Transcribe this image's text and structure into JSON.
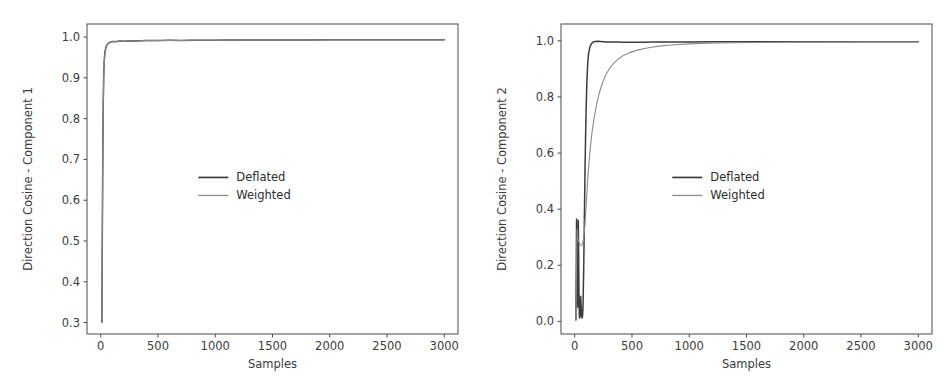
{
  "figure": {
    "background": "#ffffff",
    "panel_count": 2
  },
  "chart_data": [
    {
      "panel": "left",
      "type": "line",
      "title": "",
      "xlabel": "Samples",
      "ylabel": "Direction Cosine - Component 1",
      "xlim": [
        -120,
        3120
      ],
      "ylim": [
        0.272,
        1.032
      ],
      "xticks": [
        0,
        500,
        1000,
        1500,
        2000,
        2500,
        3000
      ],
      "xticklabels": [
        "0",
        "500",
        "1000",
        "1500",
        "2000",
        "2500",
        "3000"
      ],
      "yticks": [
        0.3,
        0.4,
        0.5,
        0.6,
        0.7,
        0.8,
        0.9,
        1.0
      ],
      "yticklabels": [
        "0.3",
        "0.4",
        "0.5",
        "0.6",
        "0.7",
        "0.8",
        "0.9",
        "1.0"
      ],
      "grid": false,
      "legend_position": "center",
      "legend": [
        "Deflated",
        "Weighted"
      ],
      "colors": {
        "Deflated": "#3c3c3c",
        "Weighted": "#8a8a8a"
      },
      "series": [
        {
          "name": "Deflated",
          "color": "#3c3c3c",
          "x": [
            10,
            14,
            18,
            22,
            26,
            30,
            34,
            38,
            44,
            50,
            56,
            62,
            70,
            80,
            90,
            100,
            115,
            130,
            150,
            175,
            200,
            230,
            260,
            300,
            350,
            400,
            460,
            520,
            600,
            700,
            800,
            900,
            1000,
            1100,
            1250,
            1400,
            1600,
            1800,
            2000,
            2200,
            2400,
            2600,
            2800,
            3000
          ],
          "y": [
            0.301,
            0.52,
            0.71,
            0.84,
            0.905,
            0.938,
            0.955,
            0.965,
            0.973,
            0.978,
            0.981,
            0.9835,
            0.9855,
            0.987,
            0.9882,
            0.9888,
            0.9892,
            0.9886,
            0.9898,
            0.9903,
            0.9897,
            0.9905,
            0.991,
            0.9906,
            0.9912,
            0.9915,
            0.9913,
            0.9918,
            0.992,
            0.9918,
            0.9922,
            0.9924,
            0.9923,
            0.9926,
            0.9927,
            0.9928,
            0.9929,
            0.993,
            0.9931,
            0.9931,
            0.9932,
            0.9932,
            0.9933,
            0.9933
          ]
        },
        {
          "name": "Weighted",
          "color": "#8a8a8a",
          "x": [
            10,
            14,
            18,
            22,
            26,
            30,
            34,
            38,
            44,
            50,
            56,
            62,
            70,
            80,
            90,
            100,
            115,
            130,
            150,
            175,
            200,
            230,
            260,
            300,
            350,
            400,
            460,
            520,
            600,
            700,
            800,
            900,
            1000,
            1100,
            1250,
            1400,
            1600,
            1800,
            2000,
            2200,
            2400,
            2600,
            2800,
            3000
          ],
          "y": [
            0.3,
            0.515,
            0.705,
            0.836,
            0.902,
            0.936,
            0.953,
            0.963,
            0.9715,
            0.9772,
            0.9805,
            0.983,
            0.985,
            0.9866,
            0.9878,
            0.9886,
            0.9888,
            0.9884,
            0.9896,
            0.99,
            0.9895,
            0.9903,
            0.9908,
            0.9905,
            0.991,
            0.9913,
            0.9912,
            0.9916,
            0.9919,
            0.9917,
            0.9921,
            0.9923,
            0.9922,
            0.9925,
            0.9926,
            0.9927,
            0.9928,
            0.9929,
            0.993,
            0.993,
            0.9931,
            0.9931,
            0.9932,
            0.9932
          ]
        }
      ]
    },
    {
      "panel": "right",
      "type": "line",
      "title": "",
      "xlabel": "Samples",
      "ylabel": "Direction Cosine - Component 2",
      "xlim": [
        -120,
        3120
      ],
      "ylim": [
        -0.045,
        1.06
      ],
      "xticks": [
        0,
        500,
        1000,
        1500,
        2000,
        2500,
        3000
      ],
      "xticklabels": [
        "0",
        "500",
        "1000",
        "1500",
        "2000",
        "2500",
        "3000"
      ],
      "yticks": [
        0.0,
        0.2,
        0.4,
        0.6,
        0.8,
        1.0
      ],
      "yticklabels": [
        "0.0",
        "0.2",
        "0.4",
        "0.6",
        "0.8",
        "1.0"
      ],
      "grid": false,
      "legend_position": "center",
      "legend": [
        "Deflated",
        "Weighted"
      ],
      "colors": {
        "Deflated": "#3c3c3c",
        "Weighted": "#8a8a8a"
      },
      "series": [
        {
          "name": "Deflated",
          "color": "#3c3c3c",
          "x": [
            10,
            13,
            16,
            19,
            22,
            25,
            28,
            31,
            34,
            37,
            40,
            44,
            48,
            52,
            56,
            60,
            64,
            68,
            72,
            78,
            84,
            90,
            98,
            106,
            114,
            122,
            132,
            142,
            152,
            165,
            180,
            200,
            225,
            250,
            280,
            320,
            370,
            430,
            500,
            600,
            700,
            850,
            1000,
            1200,
            1450,
            1700,
            2000,
            2300,
            2650,
            3000
          ],
          "y": [
            0.005,
            0.18,
            0.365,
            0.3,
            0.14,
            0.05,
            0.2,
            0.36,
            0.25,
            0.1,
            0.02,
            0.012,
            0.03,
            0.09,
            0.055,
            0.02,
            0.012,
            0.018,
            0.05,
            0.18,
            0.36,
            0.55,
            0.73,
            0.855,
            0.925,
            0.958,
            0.977,
            0.987,
            0.993,
            0.9965,
            0.998,
            0.9983,
            0.9975,
            0.9968,
            0.9962,
            0.9958,
            0.9955,
            0.9953,
            0.9952,
            0.9953,
            0.9955,
            0.9958,
            0.996,
            0.9963,
            0.9965,
            0.9966,
            0.9967,
            0.9968,
            0.9968,
            0.9969
          ]
        },
        {
          "name": "Weighted",
          "color": "#8a8a8a",
          "x": [
            10,
            14,
            18,
            22,
            26,
            30,
            35,
            40,
            45,
            50,
            56,
            62,
            68,
            74,
            80,
            88,
            96,
            104,
            112,
            120,
            135,
            150,
            170,
            190,
            215,
            240,
            270,
            300,
            340,
            380,
            430,
            480,
            540,
            600,
            670,
            740,
            820,
            900,
            1000,
            1100,
            1250,
            1400,
            1600,
            1800,
            2000,
            2250,
            2500,
            2750,
            3000
          ],
          "y": [
            0.004,
            0.12,
            0.28,
            0.33,
            0.3,
            0.29,
            0.285,
            0.28,
            0.275,
            0.272,
            0.27,
            0.272,
            0.278,
            0.288,
            0.305,
            0.34,
            0.39,
            0.445,
            0.5,
            0.545,
            0.615,
            0.672,
            0.728,
            0.772,
            0.815,
            0.848,
            0.878,
            0.899,
            0.92,
            0.935,
            0.949,
            0.958,
            0.966,
            0.972,
            0.977,
            0.981,
            0.9845,
            0.987,
            0.9893,
            0.9908,
            0.9922,
            0.9932,
            0.9942,
            0.9948,
            0.9953,
            0.9958,
            0.9962,
            0.9965,
            0.9967
          ]
        }
      ]
    }
  ]
}
